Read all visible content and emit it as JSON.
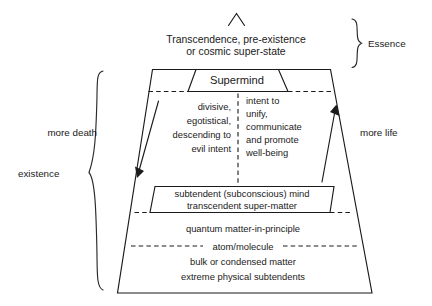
{
  "diagram": {
    "title_note": "pyramid model of existence and essence",
    "apex": {
      "peak_icon": "chevron-up-icon",
      "lines": [
        "Transcendence, pre-existence",
        "or cosmic super-state"
      ]
    },
    "supermind": {
      "label": "Supermind"
    },
    "columns": {
      "left": {
        "name": "more-death-column",
        "lines": [
          "divisive,",
          "egotistical,",
          "descending to",
          "evil intent"
        ]
      },
      "right": {
        "name": "more-life-column",
        "lines": [
          "intent to",
          "unify,",
          "communicate",
          "and promote",
          "well-being"
        ]
      }
    },
    "subtendent_band": {
      "lines": [
        "subtendent (subconscious) mind",
        "transcendent super-matter"
      ]
    },
    "matter_band": {
      "upper_line": "quantum matter-in-principle",
      "divider_label": "atom/molecule",
      "lower_lines": [
        "bulk or condensed matter",
        "extreme physical subtendents"
      ]
    },
    "annotations": {
      "essence": "Essence",
      "existence": "existence",
      "more_death": "more death",
      "more_life": "more life"
    },
    "icons": {
      "peak": "chevron-up-icon",
      "essence_brace": "curly-brace-right-icon",
      "existence_brace": "curly-brace-left-icon",
      "death_arrow": "arrow-down-icon",
      "life_arrow": "arrow-up-icon"
    },
    "colors": {
      "ink": "#1b1b1b",
      "background": "#ffffff"
    }
  }
}
